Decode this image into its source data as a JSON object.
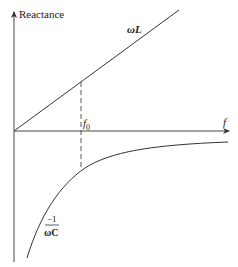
{
  "diagram": {
    "y_axis_label": "Reactance",
    "x_axis_label": "f",
    "marker_label": "f",
    "marker_subscript": "0",
    "inductive_label": "ωL",
    "capacitive_numerator": "−1",
    "capacitive_denominator": "ωC",
    "colors": {
      "line": "#333333",
      "background": "#ffffff"
    }
  }
}
